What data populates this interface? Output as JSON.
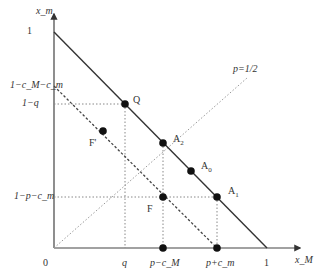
{
  "diagram": {
    "axes": {
      "x_label": "x_M",
      "y_label": "x_m",
      "origin_label": "0",
      "x_tick_one": "1",
      "y_tick_one": "1"
    },
    "y_ticks": [
      {
        "label": "1−c_M−c_m",
        "y": 86
      },
      {
        "label": "1−q",
        "y": 104
      },
      {
        "label": "1−p−c_m",
        "y": 197
      }
    ],
    "x_ticks": [
      {
        "label": "q",
        "x": 125
      },
      {
        "label": "p−c_M",
        "x": 163
      },
      {
        "label": "p+c_m",
        "x": 217
      }
    ],
    "lines": {
      "budget_line": "x_M + x_m = 1",
      "dashed_line": "x_M + x_m = 1 − c_M − c_m",
      "p_line_label": "p=1/2"
    },
    "points": [
      {
        "name": "Q",
        "x": 125,
        "y": 104
      },
      {
        "name": "A2",
        "x": 163,
        "y": 143
      },
      {
        "name": "A0",
        "x": 191,
        "y": 171
      },
      {
        "name": "A1",
        "x": 217,
        "y": 197
      },
      {
        "name": "F",
        "x": 163,
        "y": 197
      },
      {
        "name": "F'",
        "x": 103,
        "y": 131
      }
    ],
    "labels": {
      "Q": "Q",
      "A2": "A",
      "A2_sub": "2",
      "A0": "A",
      "A0_sub": "0",
      "A1": "A",
      "A1_sub": "1",
      "F": "F",
      "Fprime": "F'"
    },
    "colors": {
      "line": "#333333",
      "dotted": "#888888",
      "point": "#111111"
    }
  }
}
